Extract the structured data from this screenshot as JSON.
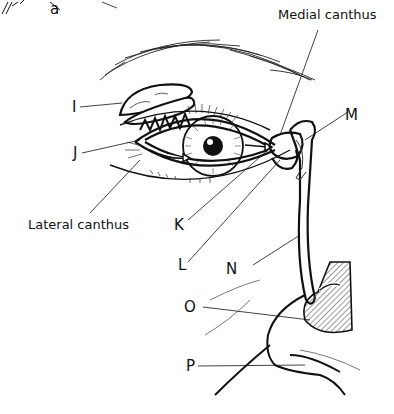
{
  "diagram": {
    "labels": {
      "a": "a",
      "medial_canthus": "Medial canthus",
      "lateral_canthus": "Lateral canthus",
      "I": "I",
      "J": "J",
      "K": "K",
      "L": "L",
      "M": "M",
      "N": "N",
      "O": "O",
      "P": "P"
    },
    "colors": {
      "line": "#111111",
      "background": "#ffffff",
      "hatch": "#555555"
    }
  }
}
